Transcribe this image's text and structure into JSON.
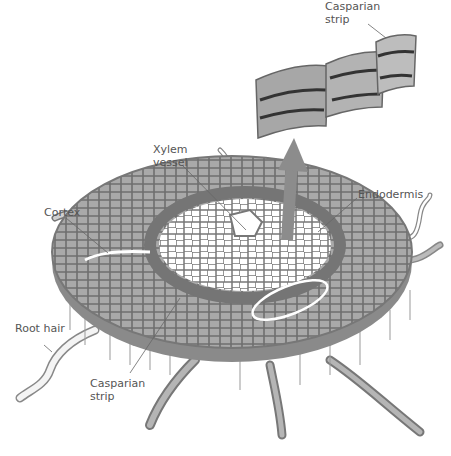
{
  "diagram": {
    "type": "root cross-section illustration",
    "labels": {
      "casparian_top": {
        "line1": "Casparian",
        "line2": "strip"
      },
      "xylem": {
        "line1": "Xylem",
        "line2": "vessel"
      },
      "endodermis": {
        "line1": "Endodermis"
      },
      "cortex": {
        "line1": "Cortex"
      },
      "root_hair": {
        "line1": "Root hair"
      },
      "casparian_bottom": {
        "line1": "Casparian",
        "line2": "strip"
      }
    },
    "colors": {
      "cortex_fill": "#a9a9a9",
      "cell_outline": "#6e6e6e",
      "endodermis_fill": "#7a7a7a",
      "xylem_fill": "#ffffff",
      "casparian_band": "#3a3a3a",
      "arrow": "#8c8c8c",
      "label_text": "#555555"
    }
  }
}
